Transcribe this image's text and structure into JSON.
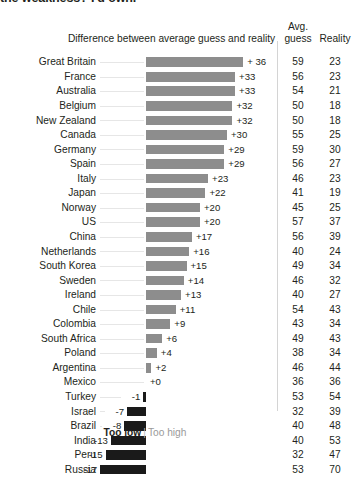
{
  "headline": "the weakness? I'd own.",
  "headers": {
    "difference": "Difference between average guess and reality",
    "avg_line1": "Avg.",
    "avg_line2": "guess",
    "reality": "Reality"
  },
  "legend": {
    "too_low": "Too low",
    "separator": "|",
    "too_high": "Too high"
  },
  "colors": {
    "positive_bar": "#8d8d8d",
    "negative_bar": "#1a1a1a",
    "text": "#231f20",
    "leader_line": "#e6e6e6",
    "divider": "#d4d4d4"
  },
  "chart_data": {
    "type": "bar",
    "title": "Difference between average guess and reality",
    "xlabel": "",
    "ylabel": "",
    "orientation": "horizontal",
    "baseline": 0,
    "grid": false,
    "legend_position": "bottom",
    "categories": [
      "Great Britain",
      "France",
      "Australia",
      "Belgium",
      "New Zealand",
      "Canada",
      "Germany",
      "Spain",
      "Italy",
      "Japan",
      "Norway",
      "US",
      "China",
      "Netherlands",
      "South Korea",
      "Sweden",
      "Ireland",
      "Chile",
      "Colombia",
      "South Africa",
      "Poland",
      "Argentina",
      "Mexico",
      "Turkey",
      "Israel",
      "Brazil",
      "India",
      "Peru",
      "Russia"
    ],
    "series": [
      {
        "name": "Difference between average guess and reality",
        "values": [
          36,
          33,
          33,
          32,
          32,
          30,
          29,
          29,
          23,
          22,
          20,
          20,
          17,
          16,
          15,
          14,
          13,
          11,
          9,
          6,
          4,
          2,
          0,
          -1,
          -7,
          -8,
          -13,
          -15,
          -17
        ],
        "labels": [
          "+ 36",
          "+33",
          "+33",
          "+32",
          "+32",
          "+30",
          "+29",
          "+29",
          "+23",
          "+22",
          "+20",
          "+20",
          "+17",
          "+16",
          "+15",
          "+14",
          "+13",
          "+11",
          "+9",
          "+6",
          "+4",
          "+2",
          "+0",
          "-1",
          "-7",
          "-8",
          "-13",
          "-15",
          "-17"
        ]
      },
      {
        "name": "Avg. guess",
        "values": [
          59,
          56,
          54,
          50,
          50,
          55,
          59,
          56,
          46,
          41,
          45,
          57,
          56,
          40,
          49,
          46,
          40,
          54,
          43,
          49,
          38,
          46,
          36,
          53,
          32,
          40,
          40,
          32,
          53
        ]
      },
      {
        "name": "Reality",
        "values": [
          23,
          23,
          21,
          18,
          18,
          25,
          30,
          27,
          23,
          19,
          25,
          37,
          39,
          24,
          34,
          32,
          27,
          43,
          34,
          43,
          34,
          44,
          36,
          54,
          39,
          48,
          53,
          47,
          70
        ]
      }
    ]
  }
}
